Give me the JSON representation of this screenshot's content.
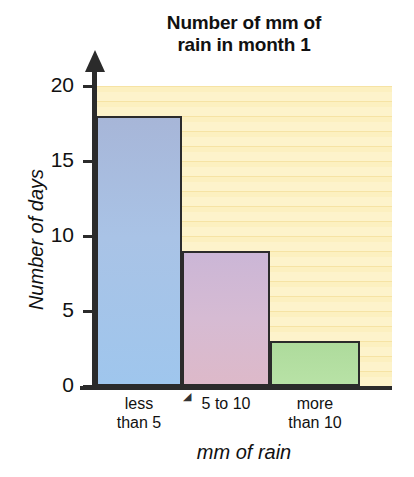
{
  "chart_data": {
    "type": "bar",
    "title": "Number of mm of\nrain in month 1",
    "xlabel": "mm of rain",
    "ylabel": "Number of days",
    "categories": [
      "less\nthan 5",
      "5 to 10",
      "more\nthan 10"
    ],
    "values": [
      18,
      9,
      3
    ],
    "ylim": [
      0,
      20
    ],
    "yticks": [
      0,
      5,
      10,
      15,
      20
    ],
    "ytick_labels": [
      "0",
      "5",
      "10",
      "15",
      "20"
    ],
    "grid": true,
    "legend": null,
    "bar_colors": [
      "#a9c3e6",
      "#d6b8d2",
      "#b3dea0"
    ],
    "bar_edge_color": "#2b2b2b",
    "plot_background": "#fbecb4",
    "stripe_color": "#f6e3a4",
    "axis_color": "#2b2b2b",
    "text_color": "#111111"
  }
}
